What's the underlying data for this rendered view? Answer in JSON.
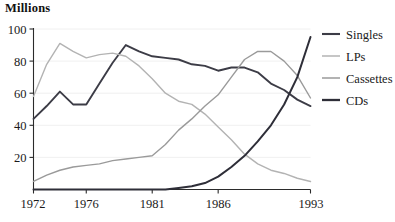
{
  "chart_data": {
    "type": "line",
    "title": "Millions",
    "xlabel": "",
    "ylabel": "Millions",
    "ylim": [
      0,
      100
    ],
    "xlim": [
      1972,
      1993
    ],
    "grid": true,
    "legend_position": "right",
    "ytick_labels": [
      "20",
      "40",
      "60",
      "80",
      "100"
    ],
    "ytick_values": [
      20,
      40,
      60,
      80,
      100
    ],
    "xtick_labels": [
      "1972",
      "1976",
      "1981",
      "1986",
      "1993"
    ],
    "xtick_values": [
      1972,
      1976,
      1981,
      1986,
      1993
    ],
    "x": [
      1972,
      1973,
      1974,
      1975,
      1976,
      1977,
      1978,
      1979,
      1980,
      1981,
      1982,
      1983,
      1984,
      1985,
      1986,
      1987,
      1988,
      1989,
      1990,
      1991,
      1992,
      1993
    ],
    "series": [
      {
        "name": "Singles",
        "color": "#3c3c46",
        "width": 1.9,
        "values": [
          44,
          52,
          61,
          53,
          53,
          66,
          79,
          90,
          86,
          83,
          82,
          81,
          78,
          77,
          74,
          76,
          76,
          73,
          66,
          62,
          56,
          52
        ]
      },
      {
        "name": "LPs",
        "color": "#b3b3b3",
        "width": 1.4,
        "values": [
          58,
          78,
          91,
          86,
          82,
          84,
          85,
          83,
          77,
          69,
          60,
          55,
          53,
          47,
          39,
          31,
          22,
          16,
          12,
          10,
          7,
          5
        ]
      },
      {
        "name": "Cassettes",
        "color": "#9a9a9a",
        "width": 1.4,
        "values": [
          5,
          9,
          12,
          14,
          15,
          16,
          18,
          19,
          20,
          21,
          28,
          37,
          44,
          52,
          59,
          70,
          81,
          86,
          86,
          80,
          71,
          57
        ]
      },
      {
        "name": "CDs",
        "color": "#2e2e38",
        "width": 2.0,
        "values": [
          0,
          0,
          0,
          0,
          0,
          0,
          0,
          0,
          0,
          0,
          0,
          1,
          2,
          4,
          8,
          14,
          21,
          30,
          40,
          53,
          70,
          95
        ]
      }
    ]
  },
  "legend": {
    "items": [
      {
        "label": "Singles",
        "swatch_color": "#3c3c46",
        "swatch_width": 2.1
      },
      {
        "label": "LPs",
        "swatch_color": "#b3b3b3",
        "swatch_width": 1.5
      },
      {
        "label": "Cassettes",
        "swatch_color": "#9a9a9a",
        "swatch_width": 1.5
      },
      {
        "label": "CDs",
        "swatch_color": "#2e2e38",
        "swatch_width": 2.3
      }
    ]
  }
}
